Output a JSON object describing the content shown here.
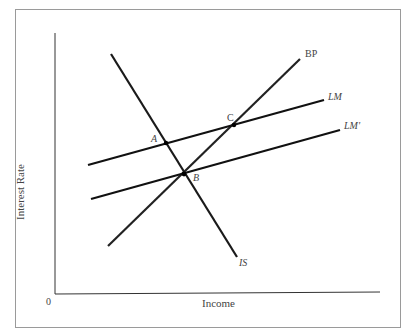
{
  "diagram": {
    "type": "IS-LM-BP macroeconomic diagram",
    "axes": {
      "x_label": "Income",
      "y_label": "Interest Rate",
      "origin_label": "0"
    },
    "curves": [
      {
        "name": "IS",
        "label": "IS",
        "slope": "downward"
      },
      {
        "name": "BP",
        "label": "BP",
        "slope": "upward"
      },
      {
        "name": "LM",
        "label": "LM",
        "slope": "upward-flat"
      },
      {
        "name": "LM'",
        "label": "LM'",
        "slope": "upward-flat"
      }
    ],
    "points": [
      {
        "label": "A",
        "at": "IS ∩ LM"
      },
      {
        "label": "B",
        "at": "IS ∩ LM' ∩ BP"
      },
      {
        "label": "C",
        "at": "LM ∩ BP"
      }
    ],
    "colors": {
      "line": "#1a1a1a",
      "frame": "#9a9a9a",
      "text": "#444444"
    }
  }
}
